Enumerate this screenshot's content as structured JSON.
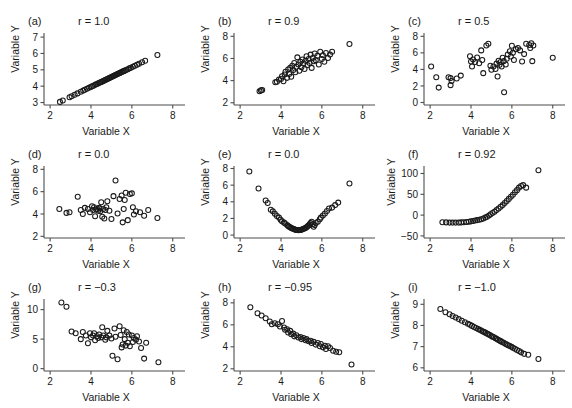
{
  "figure": {
    "ghost_text": "",
    "marker_style": "open-circle",
    "marker_color": "#1a1a1a",
    "axis_color": "#4d4d4d",
    "background": "#ffffff"
  },
  "chart_data": [
    {
      "type": "scatter",
      "panel": "a",
      "panel_label": "(a)",
      "title": "r = 1.0",
      "r": 1.0,
      "xlabel": "Variable X",
      "ylabel": "Variable Y",
      "xlim": [
        1.7,
        8.6
      ],
      "ylim": [
        2.85,
        7.25
      ],
      "xticks": [
        2,
        4,
        6,
        8
      ],
      "yticks": [
        3,
        4,
        5,
        6,
        7
      ],
      "grid": false,
      "legend": "none",
      "x": [
        2.48,
        2.62,
        2.95,
        3.05,
        3.2,
        3.34,
        3.5,
        3.62,
        3.7,
        3.8,
        3.9,
        3.98,
        4.05,
        4.12,
        4.2,
        4.26,
        4.32,
        4.38,
        4.44,
        4.5,
        4.55,
        4.6,
        4.65,
        4.7,
        4.75,
        4.8,
        4.85,
        4.9,
        4.95,
        5.0,
        5.05,
        5.1,
        5.15,
        5.2,
        5.25,
        5.3,
        5.35,
        5.4,
        5.45,
        5.5,
        5.55,
        5.6,
        5.65,
        5.72,
        5.8,
        5.88,
        5.95,
        6.05,
        6.15,
        6.25,
        6.35,
        6.5,
        6.65,
        7.25
      ],
      "y": [
        3.04,
        3.12,
        3.32,
        3.38,
        3.47,
        3.56,
        3.66,
        3.73,
        3.78,
        3.84,
        3.9,
        3.95,
        3.99,
        4.03,
        4.08,
        4.12,
        4.15,
        4.19,
        4.22,
        4.26,
        4.29,
        4.32,
        4.35,
        4.38,
        4.41,
        4.44,
        4.47,
        4.5,
        4.53,
        4.56,
        4.59,
        4.62,
        4.65,
        4.68,
        4.71,
        4.74,
        4.77,
        4.8,
        4.83,
        4.86,
        4.89,
        4.92,
        4.95,
        4.99,
        5.04,
        5.09,
        5.13,
        5.19,
        5.25,
        5.31,
        5.37,
        5.46,
        5.55,
        5.9
      ]
    },
    {
      "type": "scatter",
      "panel": "b",
      "panel_label": "(b)",
      "title": "r = 0.9",
      "r": 0.9,
      "xlabel": "Variable X",
      "ylabel": "Variable Y",
      "xlim": [
        1.7,
        8.6
      ],
      "ylim": [
        1.8,
        8.3
      ],
      "xticks": [
        2,
        4,
        6,
        8
      ],
      "yticks": [
        2,
        4,
        6,
        8
      ],
      "grid": false,
      "legend": "none",
      "x": [
        2.95,
        3.02,
        3.08,
        3.72,
        3.8,
        3.9,
        4.0,
        4.05,
        4.12,
        4.18,
        4.22,
        4.3,
        4.35,
        4.4,
        4.45,
        4.5,
        4.55,
        4.6,
        4.65,
        4.7,
        4.75,
        4.8,
        4.85,
        4.9,
        4.95,
        5.0,
        5.05,
        5.1,
        5.15,
        5.2,
        5.25,
        5.3,
        5.35,
        5.4,
        5.45,
        5.5,
        5.55,
        5.6,
        5.65,
        5.7,
        5.78,
        5.85,
        5.92,
        6.0,
        6.05,
        6.12,
        6.2,
        6.3,
        6.4,
        6.5,
        7.35
      ],
      "y": [
        3.05,
        3.12,
        3.15,
        3.85,
        3.9,
        4.1,
        4.15,
        4.4,
        3.95,
        4.55,
        4.8,
        4.25,
        5.0,
        4.6,
        5.15,
        4.35,
        5.35,
        4.95,
        5.6,
        4.75,
        5.25,
        6.1,
        5.45,
        4.9,
        5.7,
        5.2,
        5.9,
        5.55,
        5.05,
        5.8,
        6.2,
        5.4,
        5.95,
        5.6,
        6.35,
        5.15,
        6.05,
        5.75,
        6.45,
        5.85,
        6.25,
        5.45,
        6.6,
        5.95,
        6.3,
        5.7,
        6.5,
        6.05,
        6.35,
        6.6,
        7.3
      ]
    },
    {
      "type": "scatter",
      "panel": "c",
      "panel_label": "(c)",
      "title": "r = 0.5",
      "r": 0.5,
      "xlabel": "Variable X",
      "ylabel": "Variable Y",
      "xlim": [
        1.7,
        8.6
      ],
      "ylim": [
        -0.3,
        8.4
      ],
      "xticks": [
        2,
        4,
        6,
        8
      ],
      "yticks": [
        0,
        2,
        4,
        6,
        8
      ],
      "grid": false,
      "legend": "none",
      "x": [
        2.05,
        2.3,
        2.42,
        2.9,
        3.0,
        3.0,
        3.05,
        3.3,
        3.5,
        3.95,
        4.0,
        4.05,
        4.1,
        4.2,
        4.3,
        4.4,
        4.5,
        4.55,
        4.6,
        4.75,
        4.85,
        4.95,
        5.0,
        5.1,
        5.2,
        5.25,
        5.3,
        5.35,
        5.4,
        5.45,
        5.5,
        5.55,
        5.6,
        5.62,
        5.7,
        5.75,
        5.8,
        5.9,
        5.95,
        6.0,
        6.05,
        6.1,
        6.2,
        6.3,
        6.4,
        6.5,
        6.6,
        6.7,
        6.85,
        6.9,
        6.95,
        7.0,
        7.05,
        8.0
      ],
      "y": [
        4.35,
        3.05,
        1.8,
        3.05,
        2.95,
        2.1,
        2.6,
        2.9,
        3.25,
        5.6,
        4.95,
        4.35,
        5.2,
        4.9,
        5.45,
        4.75,
        6.3,
        5.15,
        3.55,
        6.9,
        7.1,
        4.45,
        3.95,
        4.35,
        4.05,
        4.7,
        3.15,
        5.05,
        4.55,
        4.9,
        4.35,
        5.4,
        5.0,
        1.25,
        4.6,
        5.3,
        5.8,
        6.2,
        5.55,
        6.85,
        6.0,
        5.15,
        6.45,
        6.6,
        6.3,
        4.95,
        5.85,
        7.1,
        6.95,
        6.6,
        7.15,
        5.0,
        6.9,
        5.4
      ]
    },
    {
      "type": "scatter",
      "panel": "d",
      "panel_label": "(d)",
      "title": "r = 0.0",
      "r": 0.0,
      "xlabel": "Variable X",
      "ylabel": "Variable Y",
      "xlim": [
        1.7,
        8.6
      ],
      "ylim": [
        1.85,
        8.3
      ],
      "xticks": [
        2,
        4,
        6,
        8
      ],
      "yticks": [
        2,
        4,
        6,
        8
      ],
      "grid": false,
      "legend": "none",
      "x": [
        2.45,
        2.8,
        2.95,
        3.35,
        3.5,
        3.6,
        3.7,
        3.85,
        3.95,
        4.05,
        4.1,
        4.15,
        4.2,
        4.25,
        4.3,
        4.35,
        4.4,
        4.42,
        4.45,
        4.5,
        4.55,
        4.6,
        4.65,
        4.7,
        4.75,
        4.8,
        4.9,
        5.0,
        5.1,
        5.2,
        5.3,
        5.4,
        5.5,
        5.55,
        5.6,
        5.65,
        5.7,
        5.8,
        5.9,
        6.0,
        6.05,
        6.1,
        6.2,
        6.4,
        6.6,
        6.8,
        7.25
      ],
      "y": [
        4.45,
        4.1,
        4.15,
        5.55,
        4.35,
        4.0,
        4.55,
        4.45,
        4.15,
        4.7,
        4.35,
        4.6,
        3.8,
        4.4,
        4.45,
        4.3,
        4.55,
        4.5,
        4.25,
        5.05,
        3.75,
        4.45,
        3.6,
        4.35,
        4.6,
        5.15,
        4.3,
        3.55,
        5.6,
        7.0,
        4.05,
        5.35,
        5.65,
        3.25,
        4.45,
        5.25,
        5.9,
        3.45,
        5.8,
        5.85,
        4.6,
        3.95,
        4.25,
        4.15,
        3.85,
        4.35,
        3.65
      ]
    },
    {
      "type": "scatter",
      "panel": "e",
      "panel_label": "(e)",
      "title": "r = 0.0",
      "r": 0.0,
      "xlabel": "Variable X",
      "ylabel": "Variable Y",
      "xlim": [
        1.7,
        8.6
      ],
      "ylim": [
        -0.35,
        8.3
      ],
      "xticks": [
        2,
        4,
        6,
        8
      ],
      "yticks": [
        0,
        2,
        4,
        6,
        8
      ],
      "grid": false,
      "legend": "none",
      "x": [
        2.45,
        2.9,
        3.25,
        3.35,
        3.5,
        3.6,
        3.7,
        3.8,
        3.9,
        3.98,
        4.05,
        4.15,
        4.2,
        4.3,
        4.35,
        4.4,
        4.45,
        4.5,
        4.55,
        4.6,
        4.65,
        4.7,
        4.75,
        4.8,
        4.85,
        4.9,
        4.95,
        5.0,
        5.05,
        5.1,
        5.15,
        5.2,
        5.25,
        5.3,
        5.35,
        5.4,
        5.45,
        5.5,
        5.55,
        5.6,
        5.65,
        5.7,
        5.8,
        5.9,
        5.95,
        6.05,
        6.15,
        6.25,
        6.35,
        6.5,
        6.65,
        6.8,
        7.35
      ],
      "y": [
        7.65,
        5.6,
        4.15,
        3.85,
        3.05,
        2.85,
        2.55,
        2.3,
        2.1,
        1.85,
        1.65,
        1.5,
        1.4,
        1.2,
        1.1,
        1.0,
        0.95,
        0.85,
        0.8,
        0.75,
        0.7,
        0.65,
        0.62,
        0.6,
        0.58,
        0.6,
        0.62,
        0.65,
        0.7,
        0.75,
        0.8,
        0.85,
        0.95,
        1.05,
        1.15,
        1.3,
        1.45,
        1.6,
        1.3,
        1.0,
        1.2,
        1.45,
        1.6,
        1.9,
        2.1,
        2.35,
        2.6,
        2.9,
        3.2,
        3.3,
        3.6,
        3.9,
        6.2
      ]
    },
    {
      "type": "scatter",
      "panel": "f",
      "panel_label": "(f)",
      "title": "r = 0.92",
      "r": 0.92,
      "xlabel": "Variable X",
      "ylabel": "Variable Y",
      "xlim": [
        1.7,
        8.6
      ],
      "ylim": [
        -55,
        118
      ],
      "xticks": [
        2,
        4,
        6,
        8
      ],
      "yticks": [
        -50,
        0,
        50,
        100
      ],
      "grid": false,
      "legend": "none",
      "x": [
        2.6,
        2.78,
        2.95,
        3.1,
        3.25,
        3.4,
        3.52,
        3.65,
        3.78,
        3.9,
        4.0,
        4.1,
        4.2,
        4.3,
        4.4,
        4.5,
        4.6,
        4.7,
        4.78,
        4.88,
        4.96,
        5.05,
        5.15,
        5.25,
        5.35,
        5.45,
        5.55,
        5.65,
        5.75,
        5.85,
        5.95,
        6.05,
        6.15,
        6.25,
        6.35,
        6.45,
        6.55,
        6.7,
        7.3
      ],
      "y": [
        -17,
        -17.5,
        -18,
        -18,
        -18,
        -18,
        -17.5,
        -17,
        -16.5,
        -16,
        -15,
        -14,
        -13,
        -12,
        -11,
        -10,
        -8,
        -6,
        -4,
        -1,
        2,
        5,
        8,
        12,
        16,
        20,
        24,
        29,
        34,
        39,
        44,
        49,
        55,
        60,
        66,
        70,
        72,
        66,
        108
      ]
    },
    {
      "type": "scatter",
      "panel": "g",
      "panel_label": "(g)",
      "title": "r = −0.3",
      "r": -0.3,
      "xlabel": "Variable X",
      "ylabel": "Variable Y",
      "xlim": [
        1.7,
        8.6
      ],
      "ylim": [
        -0.4,
        11.8
      ],
      "xticks": [
        2,
        4,
        6,
        8
      ],
      "yticks": [
        0,
        5,
        10
      ],
      "grid": false,
      "legend": "none",
      "x": [
        2.55,
        2.8,
        3.05,
        3.25,
        3.5,
        3.6,
        3.75,
        3.85,
        3.95,
        4.0,
        4.1,
        4.15,
        4.2,
        4.3,
        4.35,
        4.4,
        4.5,
        4.55,
        4.6,
        4.7,
        4.75,
        4.8,
        4.9,
        5.0,
        5.05,
        5.15,
        5.2,
        5.3,
        5.4,
        5.45,
        5.5,
        5.55,
        5.6,
        5.65,
        5.7,
        5.75,
        5.8,
        5.85,
        5.9,
        6.0,
        6.05,
        6.1,
        6.2,
        6.25,
        6.35,
        6.45,
        6.6,
        6.7,
        7.3
      ],
      "y": [
        11.2,
        10.5,
        6.3,
        6.0,
        5.0,
        6.2,
        5.6,
        4.3,
        6.0,
        5.3,
        5.6,
        6.0,
        4.8,
        5.5,
        5.2,
        5.8,
        5.3,
        7.0,
        5.6,
        4.9,
        5.3,
        6.4,
        5.6,
        5.1,
        2.2,
        6.8,
        5.4,
        1.6,
        7.2,
        5.7,
        3.6,
        4.1,
        6.5,
        5.0,
        3.9,
        6.2,
        4.4,
        5.8,
        3.8,
        5.6,
        4.5,
        5.2,
        4.9,
        5.5,
        4.6,
        3.5,
        1.7,
        4.4,
        1.1
      ]
    },
    {
      "type": "scatter",
      "panel": "h",
      "panel_label": "(h)",
      "title": "r = −0.95",
      "r": -0.95,
      "xlabel": "Variable X",
      "ylabel": "Variable Y",
      "xlim": [
        1.7,
        8.6
      ],
      "ylim": [
        1.8,
        8.35
      ],
      "xticks": [
        2,
        4,
        6,
        8
      ],
      "yticks": [
        2,
        4,
        6,
        8
      ],
      "grid": false,
      "legend": "none",
      "x": [
        2.5,
        2.85,
        3.05,
        3.25,
        3.45,
        3.55,
        3.7,
        3.85,
        3.95,
        4.05,
        4.15,
        4.2,
        4.3,
        4.35,
        4.45,
        4.5,
        4.6,
        4.65,
        4.75,
        4.85,
        4.95,
        5.0,
        5.1,
        5.2,
        5.25,
        5.35,
        5.45,
        5.5,
        5.6,
        5.7,
        5.8,
        5.9,
        5.95,
        6.05,
        6.15,
        6.2,
        6.3,
        6.4,
        6.55,
        6.7,
        6.85,
        7.45
      ],
      "y": [
        7.6,
        7.05,
        6.85,
        6.6,
        6.3,
        6.05,
        6.15,
        6.05,
        5.85,
        6.35,
        5.75,
        5.55,
        5.6,
        5.3,
        5.45,
        5.15,
        5.2,
        4.95,
        5.05,
        4.85,
        4.9,
        4.7,
        4.8,
        4.6,
        4.7,
        4.5,
        4.55,
        4.35,
        4.45,
        4.2,
        4.35,
        4.05,
        4.25,
        3.95,
        4.1,
        3.8,
        4.05,
        3.9,
        3.65,
        3.55,
        3.5,
        2.4
      ]
    },
    {
      "type": "scatter",
      "panel": "i",
      "panel_label": "(i)",
      "title": "r = −1.0",
      "r": -1.0,
      "xlabel": "Variable X",
      "ylabel": "Variable Y",
      "xlim": [
        1.7,
        8.6
      ],
      "ylim": [
        5.85,
        9.25
      ],
      "xticks": [
        2,
        4,
        6,
        8
      ],
      "yticks": [
        6,
        7,
        8,
        9
      ],
      "grid": false,
      "legend": "none",
      "x": [
        2.5,
        2.75,
        2.95,
        3.1,
        3.25,
        3.4,
        3.55,
        3.7,
        3.85,
        3.95,
        4.05,
        4.15,
        4.25,
        4.35,
        4.42,
        4.5,
        4.58,
        4.65,
        4.72,
        4.8,
        4.85,
        4.92,
        5.0,
        5.05,
        5.12,
        5.2,
        5.25,
        5.32,
        5.4,
        5.45,
        5.52,
        5.6,
        5.68,
        5.75,
        5.82,
        5.9,
        5.98,
        6.05,
        6.15,
        6.25,
        6.35,
        6.45,
        6.6,
        6.8,
        7.3
      ],
      "y": [
        8.78,
        8.62,
        8.53,
        8.45,
        8.38,
        8.3,
        8.22,
        8.15,
        8.08,
        8.03,
        7.98,
        7.93,
        7.88,
        7.83,
        7.8,
        7.76,
        7.72,
        7.69,
        7.65,
        7.61,
        7.58,
        7.55,
        7.5,
        7.47,
        7.44,
        7.4,
        7.37,
        7.33,
        7.29,
        7.26,
        7.22,
        7.18,
        7.14,
        7.1,
        7.07,
        7.03,
        6.99,
        6.95,
        6.9,
        6.84,
        6.79,
        6.73,
        6.66,
        6.62,
        6.42
      ]
    }
  ]
}
